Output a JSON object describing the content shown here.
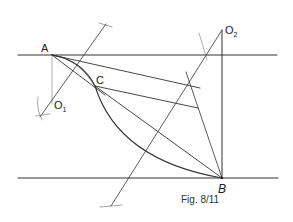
{
  "figure": {
    "caption": "Fig. 8/11",
    "points": {
      "A": {
        "label": "A",
        "x": 52,
        "y": 55
      },
      "B": {
        "label": "B",
        "x": 222,
        "y": 178
      },
      "C": {
        "label": "C",
        "x": 95,
        "y": 86
      },
      "O1": {
        "label": "O",
        "sub": "1",
        "x": 54,
        "y": 104
      },
      "O2": {
        "label": "O",
        "sub": "2",
        "x": 222,
        "y": 30
      }
    },
    "stroke_color": "#333333",
    "background": "#ffffff"
  }
}
